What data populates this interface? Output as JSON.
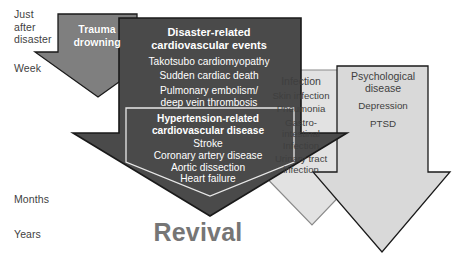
{
  "diagram": {
    "title_caption": "Revival",
    "timeline": {
      "name": "time-after-disaster-axis",
      "labels": [
        {
          "id": "just-after-disaster",
          "text": "Just\nafter\ndisaster"
        },
        {
          "id": "week",
          "text": "Week"
        },
        {
          "id": "months",
          "text": "Months"
        },
        {
          "id": "years",
          "text": "Years"
        }
      ]
    },
    "arrows": [
      {
        "id": "trauma-arrow",
        "heading": "Trauma\ndrowning",
        "fill": "#7f7f7f",
        "text_color": "#ffffff",
        "items": []
      },
      {
        "id": "cardiovascular-arrow",
        "heading": "Disaster-related\ncardiovascular events",
        "fill": "#4a4a4a",
        "text_color": "#ffffff",
        "items": [
          "Takotsubo cardiomyopathy",
          "Sudden cardiac death",
          "Pulmonary embolism/\ndeep vein thrombosis"
        ],
        "inner_box": {
          "id": "hypertension-box",
          "heading": "Hypertension-related\ncardiovascular disease",
          "items": [
            "Stroke",
            "Coronary artery disease",
            "Aortic dissection",
            "Heart failure"
          ]
        }
      },
      {
        "id": "infection-arrow",
        "heading": "Infection",
        "fill": "#e2e2e2",
        "text_color": "#3f3f3f",
        "items": [
          "Skin infection",
          "Pneumonia",
          "Gastro-\nintestinal\nInfection",
          "Urinary tract\ninfection"
        ]
      },
      {
        "id": "psychological-arrow",
        "heading": "Psychological\ndisease",
        "fill": "#d9d9d9",
        "text_color": "#3f3f3f",
        "items": [
          "Depression",
          "PTSD"
        ]
      }
    ],
    "colors": {
      "background": "#ffffff",
      "dark_arrow": "#4a4a4a",
      "mid_arrow": "#7f7f7f",
      "light_arrow": "#e2e2e2",
      "pale_arrow": "#d9d9d9",
      "outline": "#1a1a1a",
      "caption": "#767676",
      "axis_text": "#3f3f3f"
    }
  }
}
